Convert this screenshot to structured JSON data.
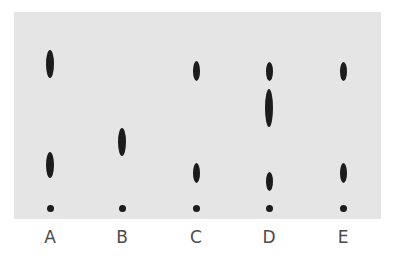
{
  "diagram": {
    "type": "thin-layer chromatography plate",
    "plate_color": "#e5e5e5",
    "spot_color": "#1c1c1c",
    "lanes": [
      {
        "label": "A",
        "x": 50,
        "spots": [
          {
            "cy": 64,
            "h": 28,
            "w": 8
          },
          {
            "cy": 165,
            "h": 26,
            "w": 8
          }
        ],
        "origin_y": 208
      },
      {
        "label": "B",
        "x": 122,
        "spots": [
          {
            "cy": 142,
            "h": 28,
            "w": 8
          }
        ],
        "origin_y": 208
      },
      {
        "label": "C",
        "x": 196,
        "spots": [
          {
            "cy": 71,
            "h": 20,
            "w": 7
          },
          {
            "cy": 173,
            "h": 20,
            "w": 7
          }
        ],
        "origin_y": 208
      },
      {
        "label": "D",
        "x": 269,
        "spots": [
          {
            "cy": 71,
            "h": 19,
            "w": 7
          },
          {
            "cy": 108,
            "h": 38,
            "w": 8
          },
          {
            "cy": 181,
            "h": 19,
            "w": 7
          }
        ],
        "origin_y": 208
      },
      {
        "label": "E",
        "x": 343,
        "spots": [
          {
            "cy": 71,
            "h": 19,
            "w": 7
          },
          {
            "cy": 173,
            "h": 20,
            "w": 7
          }
        ],
        "origin_y": 208
      }
    ]
  }
}
